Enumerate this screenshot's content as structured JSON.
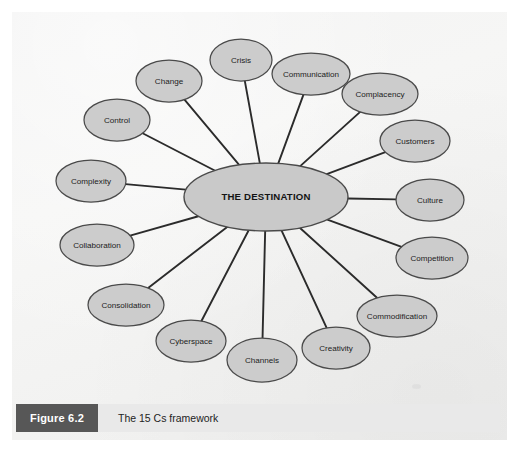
{
  "figure": {
    "caption_number": "Figure 6.2",
    "caption_title": "The 15 Cs framework",
    "accent_dark": "#575757",
    "caption_bg": "#e9e9e9",
    "page_bg": "#f3f3f3"
  },
  "chart_data": {
    "type": "diagram",
    "diagram_type": "hub-and-spoke",
    "title": "The 15 Cs framework",
    "hub": {
      "label": "THE DESTINATION",
      "cx": 266,
      "cy": 197,
      "rx": 82,
      "ry": 34,
      "fill": "#c9c9c9",
      "stroke": "#4a4a4a"
    },
    "node_style": {
      "fill": "#cccccc",
      "stroke": "#4a4a4a",
      "rx": 35,
      "ry": 22
    },
    "edge_style": {
      "stroke": "#2b2b2b",
      "width": 1.9
    },
    "node_count": 15,
    "nodes": [
      {
        "label": "Crisis",
        "cx": 241,
        "cy": 60,
        "rx": 31,
        "ry": 21
      },
      {
        "label": "Communication",
        "cx": 311,
        "cy": 74,
        "rx": 39,
        "ry": 21
      },
      {
        "label": "Complacency",
        "cx": 380,
        "cy": 94,
        "rx": 38,
        "ry": 21
      },
      {
        "label": "Customers",
        "cx": 415,
        "cy": 141,
        "rx": 35,
        "ry": 21
      },
      {
        "label": "Culture",
        "cx": 430,
        "cy": 200,
        "rx": 34,
        "ry": 21
      },
      {
        "label": "Competition",
        "cx": 432,
        "cy": 258,
        "rx": 36,
        "ry": 21
      },
      {
        "label": "Commodification",
        "cx": 397,
        "cy": 316,
        "rx": 40,
        "ry": 21
      },
      {
        "label": "Creativity",
        "cx": 336,
        "cy": 348,
        "rx": 34,
        "ry": 21
      },
      {
        "label": "Channels",
        "cx": 262,
        "cy": 360,
        "rx": 35,
        "ry": 22
      },
      {
        "label": "Cyberspace",
        "cx": 191,
        "cy": 341,
        "rx": 35,
        "ry": 21
      },
      {
        "label": "Consolidation",
        "cx": 126,
        "cy": 305,
        "rx": 38,
        "ry": 21
      },
      {
        "label": "Collaboration",
        "cx": 97,
        "cy": 245,
        "rx": 37,
        "ry": 21
      },
      {
        "label": "Complexity",
        "cx": 91,
        "cy": 181,
        "rx": 35,
        "ry": 21
      },
      {
        "label": "Control",
        "cx": 117,
        "cy": 120,
        "rx": 33,
        "ry": 21
      },
      {
        "label": "Change",
        "cx": 169,
        "cy": 81,
        "rx": 33,
        "ry": 21
      }
    ]
  }
}
